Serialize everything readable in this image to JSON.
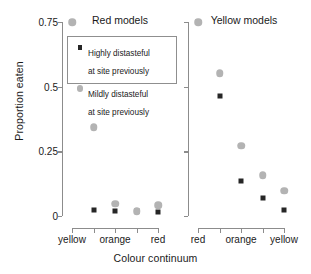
{
  "chart_data": {
    "type": "scatter",
    "title": "",
    "xlabel": "Colour continuum",
    "ylabel": "Proportion eaten",
    "ylim": [
      0,
      0.75
    ],
    "yticks": [
      0,
      0.25,
      0.5,
      0.75
    ],
    "ytick_labels": [
      "0",
      "0.25",
      "0.5",
      "0.75"
    ],
    "grid": false,
    "legend_position": "upper-left-inside-left-panel",
    "legend": [
      {
        "marker": "black-square",
        "label_line1": "Highly distasteful",
        "label_line2": "at site previously"
      },
      {
        "marker": "grey-circle",
        "label_line1": "Mildly distasteful",
        "label_line2": "at site previously"
      }
    ],
    "panels": [
      {
        "title": "Red models",
        "xtick_labels": [
          "yellow",
          "",
          "orange",
          "",
          "red"
        ],
        "x": [
          1,
          2,
          3,
          4,
          5
        ],
        "series": [
          {
            "name": "Highly distasteful at site previously",
            "marker": "black-square",
            "values": [
              0.75,
              0.025,
              0.018,
              0.018,
              0.015
            ]
          },
          {
            "name": "Mildly distasteful at site previously",
            "marker": "grey-circle",
            "values": [
              0.75,
              0.344,
              0.047,
              0.018,
              0.042
            ]
          }
        ]
      },
      {
        "title": "Yellow models",
        "xtick_labels": [
          "red",
          "",
          "orange",
          "",
          "yellow"
        ],
        "x": [
          1,
          2,
          3,
          4,
          5
        ],
        "series": [
          {
            "name": "Highly distasteful at site previously",
            "marker": "black-square",
            "values": [
              0.75,
              0.462,
              0.135,
              0.068,
              0.025
            ]
          },
          {
            "name": "Mildly distasteful at site previously",
            "marker": "grey-circle",
            "values": [
              0.75,
              0.552,
              0.272,
              0.158,
              0.098
            ]
          }
        ]
      }
    ],
    "colors": {
      "highly_distasteful": "#262626",
      "mildly_distasteful": "#b3b3b3",
      "axis": "#8c8c8c"
    }
  }
}
